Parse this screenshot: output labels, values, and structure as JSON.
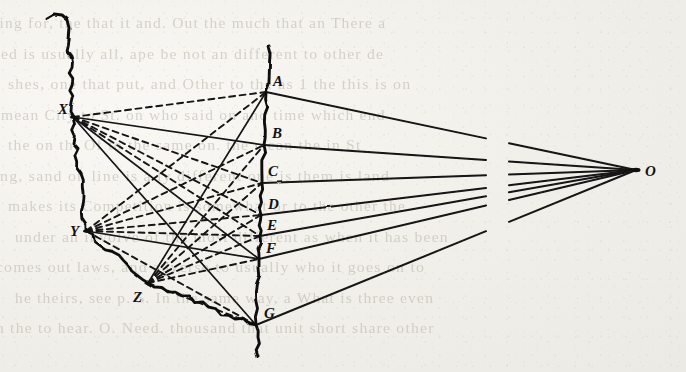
{
  "domain": "Diagram",
  "page": {
    "background_color": "#f1efe9",
    "ink_color": "#111111"
  },
  "figure": {
    "title": "",
    "type": "projection-diagram",
    "note": "Two wavy hand-drawn vertical curves: a left irregular boundary and a right picture-plane line carrying points A-G. Rays converge at centre O on the right; pencil rays from stations X, Y, Z on the left.",
    "break_gap": {
      "x_start": 486,
      "x_end": 509,
      "label": "line-break-gap"
    },
    "points": [
      {
        "id": "A",
        "label": "A",
        "x": 266,
        "y": 92,
        "label_x": 273,
        "label_y": 86,
        "kind": "plane-point"
      },
      {
        "id": "B",
        "label": "B",
        "x": 264,
        "y": 145,
        "label_x": 272,
        "label_y": 138,
        "kind": "plane-point"
      },
      {
        "id": "C",
        "label": "C",
        "x": 262,
        "y": 183,
        "label_x": 268,
        "label_y": 176,
        "kind": "plane-point"
      },
      {
        "id": "D",
        "label": "D",
        "x": 261,
        "y": 215,
        "label_x": 268,
        "label_y": 209,
        "kind": "plane-point"
      },
      {
        "id": "E",
        "label": "E",
        "x": 260,
        "y": 236,
        "label_x": 267,
        "label_y": 230,
        "kind": "plane-point"
      },
      {
        "id": "F",
        "label": "F",
        "x": 259,
        "y": 259,
        "label_x": 266,
        "label_y": 253,
        "kind": "plane-point"
      },
      {
        "id": "G",
        "label": "G",
        "x": 256,
        "y": 325,
        "label_x": 264,
        "label_y": 318,
        "kind": "plane-point"
      },
      {
        "id": "X",
        "label": "X",
        "x": 73,
        "y": 117,
        "label_x": 58,
        "label_y": 114,
        "kind": "station-point"
      },
      {
        "id": "Y",
        "label": "Y",
        "x": 86,
        "y": 231,
        "label_x": 70,
        "label_y": 236,
        "kind": "station-point"
      },
      {
        "id": "Z",
        "label": "Z",
        "x": 148,
        "y": 283,
        "label_x": 133,
        "label_y": 302,
        "kind": "station-point"
      },
      {
        "id": "O",
        "label": "O",
        "x": 636,
        "y": 170,
        "label_x": 645,
        "label_y": 176,
        "kind": "vanishing-point"
      }
    ],
    "solid_rays_to_O": [
      {
        "from": "A",
        "to": "O"
      },
      {
        "from": "B",
        "to": "O"
      },
      {
        "from": "C",
        "to": "O"
      },
      {
        "from": "D",
        "to": "O"
      },
      {
        "from": "E",
        "to": "O"
      },
      {
        "from": "F",
        "to": "O"
      },
      {
        "from": "G",
        "to": "O"
      }
    ],
    "rays_from_X": [
      {
        "to": "A",
        "style": "dashed"
      },
      {
        "to": "B",
        "style": "solid"
      },
      {
        "to": "C",
        "style": "dashed"
      },
      {
        "to": "D",
        "style": "dashed"
      },
      {
        "to": "E",
        "style": "dashed"
      },
      {
        "to": "F",
        "style": "solid"
      },
      {
        "to": "G",
        "style": "solid"
      }
    ],
    "rays_from_Y": [
      {
        "to": "A",
        "style": "dashed"
      },
      {
        "to": "B",
        "style": "dashed"
      },
      {
        "to": "C",
        "style": "dashed"
      },
      {
        "to": "D",
        "style": "dashed"
      },
      {
        "to": "E",
        "style": "dashed"
      },
      {
        "to": "F",
        "style": "solid"
      },
      {
        "to": "G",
        "style": "dashed"
      }
    ],
    "rays_from_Z": [
      {
        "to": "A",
        "style": "solid"
      },
      {
        "to": "B",
        "style": "dashed"
      },
      {
        "to": "C",
        "style": "dashed"
      },
      {
        "to": "D",
        "style": "dashed"
      },
      {
        "to": "E",
        "style": "dashed"
      },
      {
        "to": "F",
        "style": "dashed"
      },
      {
        "to": "G",
        "style": "dashed"
      }
    ],
    "station_chain": [
      {
        "from": "X",
        "to": "Y",
        "style": "wavy-solid"
      },
      {
        "from": "Y",
        "to": "Z",
        "style": "wavy-solid"
      },
      {
        "from": "Z",
        "to": "G",
        "style": "wavy-solid"
      }
    ]
  },
  "show_through_text": {
    "note": "faint text bleeding through from the reverse side of the leaf; only partially legible",
    "lines": [
      "ting for, the that it and. Out the much that an There a",
      "ed is usually all, ape be not an different to other de",
      "shes, one that put, and Other to the as 1 the this is on",
      "mean City to St. on who said on and time which end",
      "the on th. Of to the same on. the mean the in St",
      "ting, sand  on line is a ly different one is them is land",
      "makes its Competition is somewhat or to the other the",
      "under an involve of the most different as when it has been",
      "comes out laws, and adverse to usually who it goes on to",
      "he theirs, see p. 5. In the same way, a What is three even",
      "n the to  hear. O. Need. thousand that unit short share other"
    ]
  }
}
